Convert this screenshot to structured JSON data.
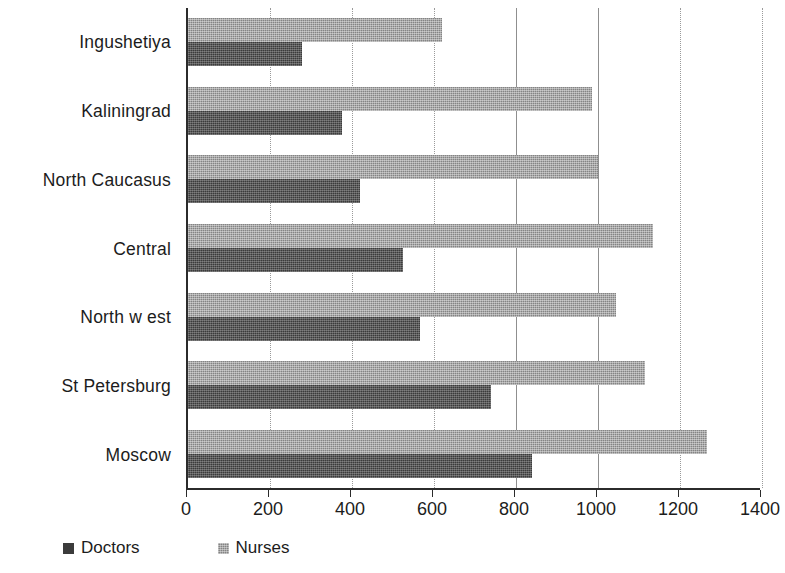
{
  "chart_data": {
    "type": "bar",
    "orientation": "horizontal",
    "title": "",
    "subtitle": "",
    "xlabel": "",
    "ylabel": "",
    "categories": [
      "Ingushetiya",
      "Kaliningrad",
      "North Caucasus",
      "Central",
      "North w est",
      "St Petersburg",
      "Moscow"
    ],
    "series": [
      {
        "name": "Doctors",
        "color": "#3b3b3b",
        "values": [
          278,
          375,
          420,
          525,
          565,
          740,
          840
        ]
      },
      {
        "name": "Nurses",
        "color": "#848484",
        "values": [
          620,
          985,
          1000,
          1135,
          1045,
          1115,
          1265
        ]
      }
    ],
    "xlim": [
      0,
      1400
    ],
    "xticks": [
      0,
      200,
      400,
      600,
      800,
      1000,
      1200,
      1400
    ],
    "xtick_labels": [
      "0",
      "200",
      "400",
      "600",
      "800",
      "1000",
      "1200",
      "1400"
    ],
    "grid": true,
    "grid_axis": "x",
    "legend": {
      "position": "bottom-left",
      "entries": [
        {
          "label": "Doctors",
          "color": "#3b3b3b"
        },
        {
          "label": "Nurses",
          "color": "#848484"
        }
      ]
    },
    "colors": {
      "axis": "#2b2b2b",
      "grid": "#9a9a9a",
      "background": "#ffffff",
      "text": "#1c1c1c"
    }
  }
}
